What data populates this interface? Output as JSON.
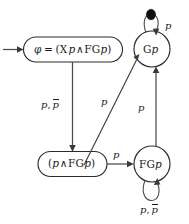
{
  "diagram": {
    "type": "automaton-state-diagram",
    "background_color": "#ffffff",
    "stroke_color": "#4a4a4a",
    "text_color": "#1a1a1a",
    "accept_marker_color": "#101010",
    "nodes": [
      {
        "id": "phi",
        "shape": "rounded-rectangle",
        "label_full": "φ = (Xp∧FGp)",
        "label_parts": {
          "phi": "φ",
          "eq": "=",
          "open": "(",
          "next_op": "X",
          "var1": "p",
          "and": "∧",
          "fg_op": "FG",
          "var2": "p",
          "close": ")"
        },
        "is_initial": true,
        "is_accepting": false
      },
      {
        "id": "Gp",
        "shape": "circle",
        "label_full": "Gp",
        "label_parts": {
          "op": "G",
          "var": "p"
        },
        "is_initial": false,
        "is_accepting": true
      },
      {
        "id": "pFGp",
        "shape": "rounded-rectangle",
        "label_full": "(p∧FGp)",
        "label_parts": {
          "open": "(",
          "var1": "p",
          "and": "∧",
          "fg_op": "FG",
          "var2": "p",
          "close": ")"
        },
        "is_initial": false,
        "is_accepting": false
      },
      {
        "id": "FGp",
        "shape": "circle",
        "label_full": "FGp",
        "label_parts": {
          "op": "FG",
          "var": "p"
        },
        "is_initial": false,
        "is_accepting": false
      }
    ],
    "edges": [
      {
        "id": "start-phi",
        "from": "start",
        "to": "phi",
        "label": "",
        "kind": "initial-arrow"
      },
      {
        "id": "phi-pFGp",
        "from": "phi",
        "to": "pFGp",
        "label_full": "p, p̄",
        "label_parts": {
          "first": "p",
          "comma": ",",
          "second": "p",
          "second_negated": true
        },
        "kind": "straight-vertical"
      },
      {
        "id": "pFGp-Gp",
        "from": "pFGp",
        "to": "Gp",
        "label_full": "p",
        "label_parts": {
          "first": "p",
          "second_negated": false
        },
        "kind": "diagonal"
      },
      {
        "id": "pFGp-FGp",
        "from": "pFGp",
        "to": "FGp",
        "label_full": "p",
        "label_parts": {
          "first": "p",
          "second_negated": false
        },
        "kind": "straight-horizontal"
      },
      {
        "id": "FGp-Gp",
        "from": "FGp",
        "to": "Gp",
        "label_full": "p",
        "label_parts": {
          "first": "p",
          "second_negated": false
        },
        "kind": "straight-vertical"
      },
      {
        "id": "Gp-Gp",
        "from": "Gp",
        "to": "Gp",
        "label_full": "p",
        "label_parts": {
          "first": "p",
          "second_negated": false
        },
        "kind": "self-loop-top"
      },
      {
        "id": "FGp-FGp",
        "from": "FGp",
        "to": "FGp",
        "label_full": "p, p̄",
        "label_parts": {
          "first": "p",
          "comma": ",",
          "second": "p",
          "second_negated": true
        },
        "kind": "self-loop-bottom"
      }
    ]
  }
}
